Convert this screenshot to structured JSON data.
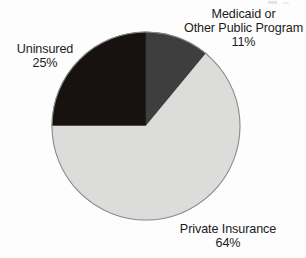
{
  "chart_data": {
    "type": "pie",
    "title": "",
    "subtitle": "",
    "xlabel": "",
    "ylabel": "",
    "legend_position": "none",
    "grid": false,
    "start_angle_deg": 0,
    "direction": "clockwise",
    "categories": [
      "Medicaid or Other Public Program",
      "Private Insurance",
      "Uninsured"
    ],
    "values": [
      11,
      64,
      25
    ],
    "value_unit": "%",
    "slices": [
      {
        "name": "Medicaid or Other Public Program",
        "label_line1": "Medicaid or",
        "label_line2": "Other Public Program",
        "value": 11,
        "value_text": "11%",
        "color": "#3e3e3e",
        "start_deg": 0,
        "end_deg": 39.6
      },
      {
        "name": "Private Insurance",
        "label_line1": "Private Insurance",
        "label_line2": "",
        "value": 64,
        "value_text": "64%",
        "color": "#dcdcda",
        "start_deg": 39.6,
        "end_deg": 270
      },
      {
        "name": "Uninsured",
        "label_line1": "Uninsured",
        "label_line2": "",
        "value": 25,
        "value_text": "25%",
        "color": "#17120f",
        "start_deg": 270,
        "end_deg": 360
      }
    ],
    "geometry": {
      "center_x": 146,
      "center_y": 126,
      "radius": 94,
      "outline_color": "#8c8c8c"
    }
  },
  "labels": {
    "medicaid": {
      "line1": "Medicaid or",
      "line2": "Other Public Program",
      "percent": "11%"
    },
    "uninsured": {
      "line1": "Uninsured",
      "percent": "25%"
    },
    "private": {
      "line1": "Private Insurance",
      "percent": "64%"
    }
  }
}
